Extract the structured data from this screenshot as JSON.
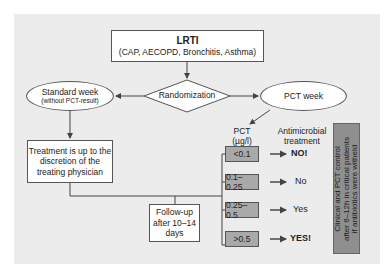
{
  "top_box": {
    "title": "LRTI",
    "subtitle": "(CAP, AECOPD, Bronchitis, Asthma)"
  },
  "randomization": {
    "label": "Randomization"
  },
  "standard_week": {
    "title": "Standard week",
    "subtitle": "(without PCT-result)"
  },
  "pct_week": {
    "label": "PCT week"
  },
  "treatment_box": {
    "line1": "Treatment is up to the",
    "line2": "discretion of the",
    "line3": "treating physician"
  },
  "follow_up": {
    "line1": "Follow-up",
    "line2": "after 10–14",
    "line3": "days"
  },
  "pct_header": {
    "line1": "PCT",
    "line2": "(µg/l)"
  },
  "antimicrobial_header": {
    "line1": "Antimicrobial",
    "line2": "treatment"
  },
  "pct_ranges": [
    {
      "range": "<0.1",
      "result": "NO!"
    },
    {
      "range": "0.1–0.25",
      "result": "No"
    },
    {
      "range": "0.25–0.5",
      "result": "Yes"
    },
    {
      "range": ">0.5",
      "result": "YES!"
    }
  ],
  "side_note": {
    "line1": "Clinical and PCT control",
    "line2": "after 6–12h in critical patients",
    "line3": "if antibiotics were witheld"
  },
  "colors": {
    "panel_bg": "#ececec",
    "range_box": "#a9a9a9",
    "side_box": "#8f8f8f",
    "line": "#444444"
  }
}
